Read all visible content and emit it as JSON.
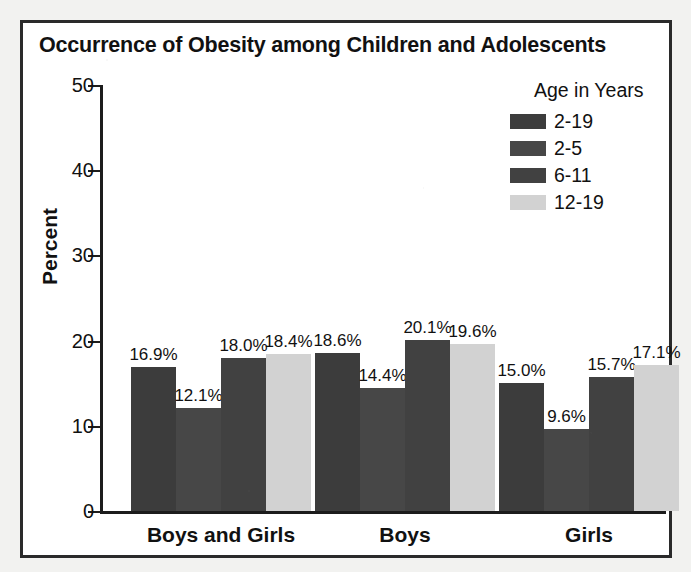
{
  "chart_data": {
    "type": "bar",
    "title": "Occurrence of Obesity among Children and Adolescents",
    "xlabel": "",
    "ylabel": "Percent",
    "ylim": [
      0,
      50
    ],
    "yticks": [
      0,
      10,
      20,
      30,
      40,
      50
    ],
    "ytick_labels": [
      "0",
      "10",
      "20",
      "30",
      "40",
      "50"
    ],
    "grid": false,
    "legend_position": "top-right",
    "legend_title": "Age in Years",
    "categories": [
      "Boys and Girls",
      "Boys",
      "Girls"
    ],
    "series": [
      {
        "name": "2-19",
        "color": "#3c3c3c",
        "values": [
          16.9,
          18.6,
          15.0
        ],
        "labels": [
          "16.9%",
          "18.6%",
          "15.0%"
        ]
      },
      {
        "name": "2-5",
        "color": "#474747",
        "values": [
          12.1,
          14.4,
          9.6
        ],
        "labels": [
          "12.1%",
          "14.4%",
          "9.6%"
        ]
      },
      {
        "name": "6-11",
        "color": "#414141",
        "values": [
          18.0,
          20.1,
          15.7
        ],
        "labels": [
          "18.0%",
          "20.1%",
          "15.7%"
        ]
      },
      {
        "name": "12-19",
        "color": "#d2d2d2",
        "values": [
          18.4,
          19.6,
          17.1
        ],
        "labels": [
          "18.4%",
          "19.6%",
          "17.1%"
        ]
      }
    ]
  },
  "figure": {
    "frame_color": "#2a2a2a",
    "background": "#ffffff"
  }
}
